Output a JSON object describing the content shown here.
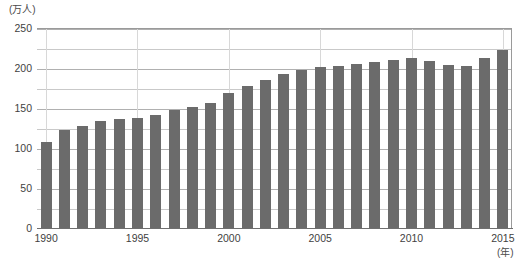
{
  "chart_data": {
    "type": "bar",
    "title": "",
    "xlabel": "年",
    "ylabel": "万人",
    "y_unit_label": "(万人)",
    "x_unit_label": "(年)",
    "ylim": [
      0,
      250
    ],
    "y_ticks_labeled": [
      0,
      50,
      100,
      150,
      200,
      250
    ],
    "y_gridline_step": 25,
    "grid": true,
    "legend": false,
    "bar_color": "#6b6b6b",
    "categories": [
      "1990",
      "1991",
      "1992",
      "1993",
      "1994",
      "1995",
      "1996",
      "1997",
      "1998",
      "1999",
      "2000",
      "2001",
      "2002",
      "2003",
      "2004",
      "2005",
      "2006",
      "2007",
      "2008",
      "2009",
      "2010",
      "2011",
      "2012",
      "2013",
      "2014",
      "2015"
    ],
    "values": [
      107,
      123,
      128,
      134,
      136,
      137,
      141,
      148,
      151,
      156,
      169,
      178,
      185,
      192,
      197,
      201,
      203,
      205,
      208,
      210,
      212,
      209,
      204,
      203,
      212,
      222
    ],
    "x_tick_labels": [
      "1990",
      "1995",
      "2000",
      "2005",
      "2010",
      "2015"
    ]
  }
}
